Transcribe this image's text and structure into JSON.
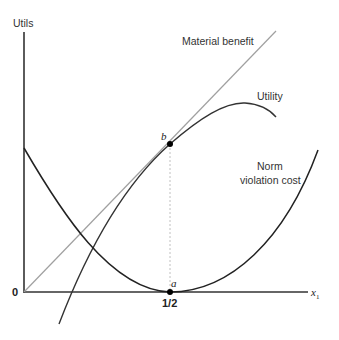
{
  "diagram": {
    "y_axis_label": "Utils",
    "x_axis_label": "x",
    "x_axis_subscript": "1",
    "origin_label": "0",
    "tick_label": "1/2",
    "curves": [
      {
        "name": "Material benefit",
        "label": "Material benefit",
        "color": "#a0a0a0",
        "shape": "straight line through origin"
      },
      {
        "name": "Utility",
        "label": "Utility",
        "color": "#333333",
        "shape": "concave curve, tangent to material benefit at b"
      },
      {
        "name": "Norm violation cost",
        "label_line1": "Norm",
        "label_line2": "violation cost",
        "color": "#222222",
        "shape": "convex parabola with minimum at a"
      }
    ],
    "points": [
      {
        "name": "a",
        "label": "a",
        "x": "1/2",
        "desc": "minimum of norm violation cost, on x-axis"
      },
      {
        "name": "b",
        "label": "b",
        "x": "1/2",
        "desc": "tangency of utility and material benefit"
      }
    ],
    "colors": {
      "axis": "#333333",
      "material_benefit": "#a0a0a0",
      "utility": "#333333",
      "norm_cost": "#222222",
      "dashed_guide": "#b0b0b0",
      "point": "#000000"
    }
  }
}
